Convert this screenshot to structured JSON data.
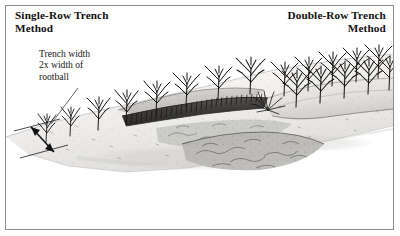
{
  "figure": {
    "border_color": "#8e8e8e",
    "background": "#ffffff",
    "ink_color": "#141313"
  },
  "titles": {
    "left": "Single-Row Trench\nMethod",
    "right": "Double-Row Trench\nMethod"
  },
  "annotation": {
    "callout_text": "Trench width\n2x width of\nrootball"
  },
  "illustration": {
    "subject": "pen-and-ink landscape showing two nursery tree planting trench layouts on a sloping ground plane",
    "left_scene": "single row of bare-root trees beside a dark excavated trench with mounded backfill",
    "right_scene": "double staggered rows of bare-root trees on a raised planting bed",
    "dimension_arrow": "double-headed arrow spanning the trench width at lower left",
    "leader_line": "thin diagonal line from callout text down to the trench edge"
  }
}
